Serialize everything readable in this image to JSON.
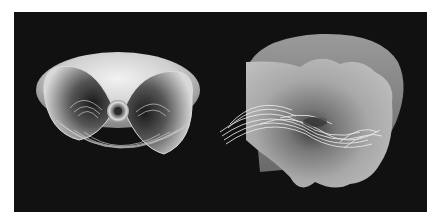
{
  "figure": {
    "background": "#111111",
    "page_background": "#ffffff",
    "panels": [
      {
        "name": "left-rendering",
        "description": "Symmetric toroidal surface with vortex core and swirling streamlines"
      },
      {
        "name": "right-rendering",
        "description": "Irregular translucent surface with swirling streamlines"
      }
    ]
  }
}
